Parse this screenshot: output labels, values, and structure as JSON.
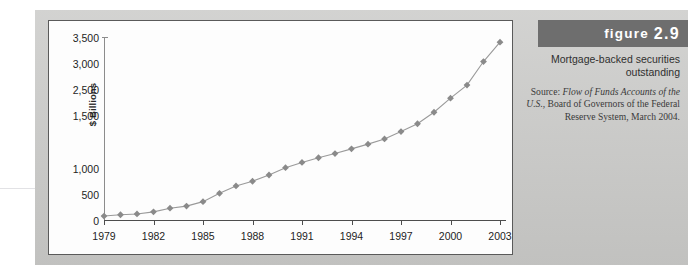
{
  "figure": {
    "banner_label": "figure",
    "number": "2.9",
    "title": "Mortgage-backed securities outstanding",
    "source_prefix": "Source:",
    "source_italic_1": "Flow of Funds",
    "source_italic_2": "Accounts of the U.S.",
    "source_rest": ", Board of Governors of the Federal Reserve System, March 2004."
  },
  "chart_data": {
    "type": "line",
    "title": "Mortgage-backed securities outstanding",
    "xlabel": "",
    "ylabel": "$ Billions",
    "x": [
      1979,
      1980,
      1981,
      1982,
      1983,
      1984,
      1985,
      1986,
      1987,
      1988,
      1989,
      1990,
      1991,
      1992,
      1993,
      1994,
      1995,
      1996,
      1997,
      1998,
      1999,
      2000,
      2001,
      2002,
      2003
    ],
    "values": [
      95,
      120,
      135,
      175,
      245,
      285,
      370,
      530,
      670,
      760,
      880,
      1020,
      1120,
      1210,
      1290,
      1380,
      1470,
      1570,
      1710,
      1860,
      2080,
      2350,
      2600,
      3050,
      3420
    ],
    "xlim": [
      1979,
      2003
    ],
    "ylim": [
      0,
      3500
    ],
    "xtick_labels": [
      "1979",
      "1982",
      "1985",
      "1988",
      "1991",
      "1994",
      "1997",
      "2000",
      "2003"
    ],
    "xtick_values": [
      1979,
      1982,
      1985,
      1988,
      1991,
      1994,
      1997,
      2000,
      2003
    ],
    "ytick_labels": [
      "3,500",
      "3,000",
      "2,500",
      "1,500",
      "1,000",
      "500",
      "0"
    ],
    "ytick_values": [
      3500,
      3000,
      2500,
      2000,
      1000,
      500,
      0
    ],
    "grid": false,
    "legend": "none",
    "marker": "diamond",
    "series_color": "#8a8a8a",
    "line_color": "#9a9a9a"
  }
}
